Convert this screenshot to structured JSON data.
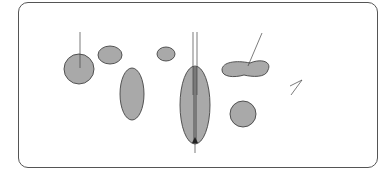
{
  "diagram": {
    "labels": {
      "embedded_protein": [
        "Embedded",
        "protein"
      ],
      "channel_forming_protein": [
        "Channel-forming",
        "protein"
      ],
      "surface_protein": [
        "Surface",
        "protein"
      ],
      "double_layer": [
        "Double layer of",
        "phospholipid"
      ],
      "channel": "Channel"
    },
    "colors": {
      "protein_fill": "#a9a9a9",
      "line": "#333333",
      "background": "#ffffff"
    }
  }
}
